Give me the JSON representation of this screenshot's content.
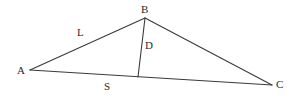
{
  "figure": {
    "background_color": "#ffffff",
    "stroke_color": "#3a3a3a",
    "text_color": "#2b2b2b",
    "stroke_width": 1.1,
    "width": 297,
    "height": 99
  },
  "points": {
    "A": {
      "label": "A",
      "x": 30,
      "y": 70,
      "label_x": 17,
      "label_y": 74
    },
    "B": {
      "label": "B",
      "x": 145,
      "y": 18,
      "label_x": 141,
      "label_y": 13
    },
    "C": {
      "label": "C",
      "x": 272,
      "y": 85,
      "label_x": 276,
      "label_y": 88
    },
    "F": {
      "label": "",
      "x": 138,
      "y": 77,
      "label_x": 138,
      "label_y": 77
    }
  },
  "segments": [
    {
      "name": "side-AB",
      "from": "A",
      "to": "B",
      "label": "L",
      "label_x": 77,
      "label_y": 36
    },
    {
      "name": "side-BC",
      "from": "B",
      "to": "C",
      "label": "",
      "label_x": 0,
      "label_y": 0
    },
    {
      "name": "side-AC",
      "from": "A",
      "to": "C",
      "label": "S",
      "label_x": 104,
      "label_y": 90
    },
    {
      "name": "cevian-BF",
      "from": "B",
      "to": "F",
      "label": "D",
      "label_x": 145,
      "label_y": 49
    }
  ],
  "labels": {
    "A": "A",
    "B": "B",
    "C": "C",
    "L": "L",
    "D": "D",
    "S": "S"
  }
}
